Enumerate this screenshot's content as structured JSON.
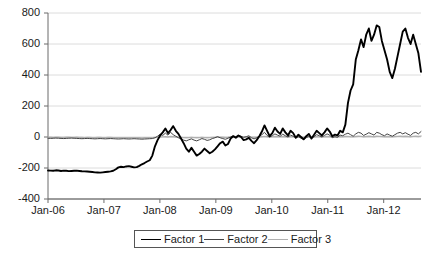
{
  "chart_data": {
    "type": "line",
    "title": "",
    "subtitle": "",
    "xlabel": "",
    "ylabel": "",
    "grid": true,
    "legend_position": "bottom",
    "ylim": [
      -400,
      800
    ],
    "yticks": [
      800,
      600,
      400,
      200,
      0,
      -200,
      -400
    ],
    "ytick_labels": [
      "800",
      "600",
      "400",
      "200",
      "0",
      "-200",
      "-400"
    ],
    "xticks": [
      0,
      12,
      24,
      36,
      48,
      60,
      72
    ],
    "xtick_labels": [
      "Jan-06",
      "Jan-07",
      "Jan-08",
      "Jan-09",
      "Jan-10",
      "Jan-11",
      "Jan-12"
    ],
    "xlim": [
      0,
      80
    ],
    "x_unit": "months since Jan-2006",
    "series": [
      {
        "name": "Factor 1",
        "color": "#000000",
        "width": 1.9,
        "values": [
          -216,
          -217,
          -218,
          -215,
          -216,
          -219,
          -217,
          -218,
          -220,
          -219,
          -218,
          -217,
          -219,
          -221,
          -222,
          -223,
          -224,
          -226,
          -228,
          -229,
          -230,
          -228,
          -226,
          -224,
          -222,
          -218,
          -208,
          -196,
          -192,
          -194,
          -190,
          -188,
          -192,
          -196,
          -194,
          -186,
          -176,
          -168,
          -158,
          -150,
          -120,
          -60,
          -20,
          10,
          30,
          55,
          25,
          45,
          70,
          40,
          20,
          -10,
          -40,
          -75,
          -95,
          -70,
          -95,
          -120,
          -110,
          -95,
          -75,
          -90,
          -105,
          -95,
          -80,
          -60,
          -40,
          -30,
          -55,
          -45,
          -10,
          5,
          -5,
          10,
          0,
          -20,
          -15,
          -5,
          -25,
          -40,
          -20,
          5,
          35,
          75,
          40,
          5,
          25,
          60,
          35,
          20,
          55,
          30,
          10,
          40,
          25,
          -5,
          15,
          0,
          -15,
          5,
          20,
          -10,
          15,
          40,
          25,
          10,
          30,
          55,
          35,
          5,
          15,
          10,
          40,
          30,
          80,
          220,
          300,
          340,
          500,
          560,
          630,
          580,
          660,
          700,
          620,
          660,
          720,
          710,
          620,
          560,
          500,
          420,
          380,
          440,
          520,
          600,
          680,
          700,
          640,
          600,
          660,
          600,
          540,
          420
        ]
      },
      {
        "name": "Factor 2",
        "color": "#444444",
        "width": 1.0,
        "values": [
          -8,
          -9,
          -8,
          -7,
          -8,
          -9,
          -10,
          -9,
          -8,
          -7,
          -8,
          -9,
          -10,
          -11,
          -10,
          -9,
          -10,
          -11,
          -12,
          -11,
          -10,
          -11,
          -12,
          -11,
          -10,
          -11,
          -12,
          -13,
          -12,
          -11,
          -12,
          -13,
          -12,
          -11,
          -12,
          -13,
          -14,
          -13,
          -12,
          -11,
          -10,
          -5,
          5,
          18,
          10,
          25,
          12,
          30,
          15,
          5,
          -5,
          -12,
          -20,
          -25,
          -18,
          -12,
          -20,
          -25,
          -18,
          -10,
          -15,
          -22,
          -18,
          -10,
          -5,
          2,
          -5,
          -10,
          -15,
          -8,
          0,
          8,
          2,
          10,
          5,
          -2,
          2,
          8,
          -5,
          -12,
          -5,
          5,
          15,
          30,
          10,
          0,
          8,
          20,
          12,
          5,
          18,
          8,
          0,
          12,
          5,
          -5,
          2,
          -8,
          -15,
          -5,
          5,
          -10,
          2,
          15,
          8,
          0,
          10,
          20,
          12,
          -5,
          2,
          -2,
          12,
          8,
          18,
          25,
          15,
          5,
          20,
          30,
          25,
          10,
          18,
          28,
          20,
          12,
          30,
          25,
          15,
          8,
          20,
          12,
          5,
          15,
          25,
          30,
          20,
          28,
          18,
          10,
          25,
          30,
          20,
          35
        ]
      },
      {
        "name": "Factor 3",
        "color": "#b0b0b0",
        "width": 1.4,
        "values": [
          -2,
          -2,
          -3,
          -2,
          -2,
          -3,
          -3,
          -2,
          -2,
          -3,
          -3,
          -2,
          -3,
          -3,
          -4,
          -3,
          -3,
          -4,
          -4,
          -3,
          -3,
          -4,
          -4,
          -3,
          -3,
          -4,
          -4,
          -5,
          -4,
          -4,
          -5,
          -5,
          -4,
          -4,
          -5,
          -5,
          -6,
          -5,
          -5,
          -4,
          -4,
          -3,
          -2,
          0,
          1,
          2,
          0,
          3,
          2,
          0,
          -2,
          -3,
          -4,
          -5,
          -4,
          -3,
          -4,
          -5,
          -4,
          -3,
          -4,
          -5,
          -4,
          -3,
          -2,
          0,
          -1,
          -2,
          -3,
          -2,
          0,
          1,
          0,
          1,
          0,
          -1,
          0,
          1,
          -1,
          -2,
          -1,
          0,
          2,
          4,
          2,
          0,
          1,
          3,
          2,
          1,
          3,
          2,
          0,
          2,
          1,
          -1,
          0,
          -1,
          -2,
          -1,
          1,
          -1,
          0,
          2,
          1,
          0,
          2,
          3,
          2,
          -1,
          0,
          0,
          2,
          1,
          3,
          4,
          2,
          1,
          3,
          5,
          4,
          2,
          3,
          5,
          3,
          2,
          5,
          4,
          3,
          1,
          3,
          2,
          1,
          3,
          4,
          5,
          3,
          5,
          3,
          2,
          4,
          5,
          3,
          6
        ]
      }
    ]
  },
  "legend": {
    "entries": [
      {
        "label": "Factor 1"
      },
      {
        "label": "Factor 2"
      },
      {
        "label": "Factor 3"
      }
    ]
  }
}
